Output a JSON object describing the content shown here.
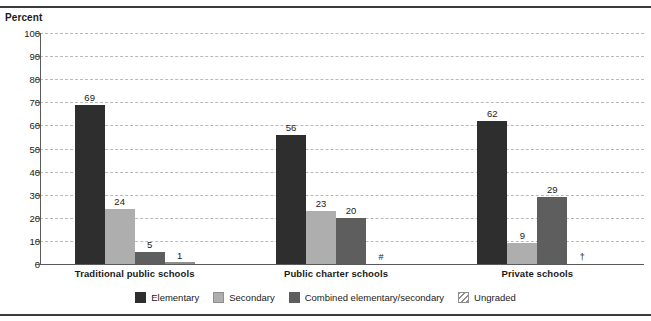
{
  "chart_data": {
    "type": "bar",
    "title": "",
    "xlabel": "",
    "ylabel": "Percent",
    "ylim": [
      0,
      100
    ],
    "ytick_step": 10,
    "yticks": [
      100,
      90,
      80,
      70,
      60,
      50,
      40,
      30,
      20,
      10,
      0
    ],
    "grid": true,
    "legend_position": "bottom",
    "categories": [
      "Traditional public schools",
      "Public charter schools",
      "Private schools"
    ],
    "series": [
      {
        "name": "Elementary",
        "color": "#2e2e2e",
        "values": [
          69,
          56,
          62
        ],
        "labels": [
          "69",
          "56",
          "62"
        ]
      },
      {
        "name": "Secondary",
        "color": "#aeaeae",
        "values": [
          24,
          23,
          9
        ],
        "labels": [
          "24",
          "23",
          "9"
        ]
      },
      {
        "name": "Combined elementary/secondary",
        "color": "#5e5e5e",
        "values": [
          5,
          20,
          29
        ],
        "labels": [
          "5",
          "20",
          "29"
        ]
      },
      {
        "name": "Ungraded",
        "color": "#dedede",
        "values": [
          1,
          0,
          0
        ],
        "labels": [
          "1",
          "#",
          "†"
        ]
      }
    ]
  },
  "axis": {
    "y_title": "Percent"
  },
  "legend": {
    "items": [
      {
        "label": "Elementary",
        "swatch": "elementary"
      },
      {
        "label": "Secondary",
        "swatch": "secondary"
      },
      {
        "label": "Combined elementary/secondary",
        "swatch": "combined"
      },
      {
        "label": "Ungraded",
        "swatch": "ungraded"
      }
    ]
  },
  "groups": [
    {
      "label": "Traditional public schools"
    },
    {
      "label": "Public charter schools"
    },
    {
      "label": "Private schools"
    }
  ],
  "colors": {
    "elementary": "#2e2e2e",
    "secondary": "#aeaeae",
    "combined": "#5e5e5e",
    "ungraded": "#dedede",
    "grid": "#b9b9b9",
    "axis": "#5a5a5a",
    "rule": "#3b3b3b",
    "text": "#1a1a1a"
  }
}
